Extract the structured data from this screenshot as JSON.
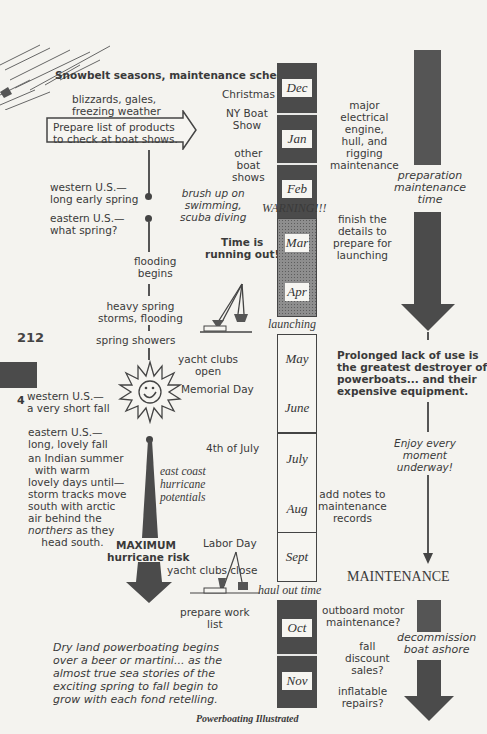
{
  "page": {
    "page_number": "212",
    "chapter_tab": "4",
    "footer": "Powerboating Illustrated"
  },
  "header": {
    "title": "Snowbelt seasons, maintenance schedule."
  },
  "months": [
    {
      "label": "Dec",
      "style": "dark"
    },
    {
      "label": "Jan",
      "style": "dark"
    },
    {
      "label": "Feb",
      "style": "dark"
    },
    {
      "label": "Mar",
      "style": "dotted"
    },
    {
      "label": "Apr",
      "style": "dotted"
    },
    {
      "label": "May",
      "style": "light"
    },
    {
      "label": "June",
      "style": "light"
    },
    {
      "label": "July",
      "style": "light"
    },
    {
      "label": "Aug",
      "style": "light"
    },
    {
      "label": "Sept",
      "style": "light"
    },
    {
      "label": "Oct",
      "style": "dark"
    },
    {
      "label": "Nov",
      "style": "dark"
    }
  ],
  "column_markers": {
    "warning": "WARNING!!!",
    "launching": "launching",
    "haul_out": "haul out time"
  },
  "left_notes": {
    "weather": "blizzards, gales,\nfreezing weather",
    "prepare_list": "Prepare list of products\nto check at boat shows.",
    "western_spring": "western U.S.—\nlong early spring",
    "eastern_spring": "eastern U.S.—\nwhat spring?",
    "flooding": "flooding\nbegins",
    "heavy_spring": "heavy spring\nstorms, flooding",
    "spring_showers": "spring showers",
    "western_fall": "western U.S.—\na very short fall",
    "eastern_fall_1": "eastern U.S.—\nlong, lovely fall",
    "eastern_fall_2": "an Indian summer\n  with warm\nlovely days until—\nstorm tracks move\nsouth with arctic\nair behind the",
    "eastern_fall_northers": "northers",
    "eastern_fall_3": " as they\n    head south.",
    "max_risk_1": "MAXIMUM",
    "max_risk_2": "hurricane risk",
    "dry_land": "Dry land powerboating begins\nover a beer or martini... as the\nalmost true sea stories of the\nexciting spring to fall begin to\ngrow with each fond retelling."
  },
  "mid_notes": {
    "christmas": "Christmas",
    "ny_boat_show": "NY Boat\nShow",
    "other_shows": "other\nboat\nshows",
    "brush_up": "brush up on\nswimming,\nscuba diving",
    "time_running": "Time is\nrunning out!",
    "yacht_open": "yacht clubs\nopen",
    "memorial_day": "Memorial Day",
    "july4": "4th of July",
    "hurricane_potentials": "east coast\nhurricane\npotentials",
    "labor_day": "Labor Day",
    "yacht_close": "yacht clubs close",
    "work_list": "prepare work\nlist"
  },
  "right_notes": {
    "major_maint": "major\nelectrical\nengine,\nhull, and\nrigging\nmaintenance",
    "finish_details": "finish the\ndetails to\nprepare for\nlaunching",
    "add_notes": "add notes to\nmaintenance\nrecords",
    "outboard": "outboard motor\nmaintenance?",
    "fall_sales": "fall\ndiscount\nsales?",
    "inflatable": "inflatable\nrepairs?"
  },
  "far_right": {
    "prep_time": "preparation\nmaintenance\ntime",
    "prolonged": "Prolonged lack of use is\nthe greatest destroyer of\npowerboats... and their\nexpensive equipment.",
    "enjoy": "Enjoy every\nmoment\nunderway!",
    "maintenance": "MAINTENANCE",
    "decommission": "decommission\nboat ashore"
  },
  "icons": {
    "sun": "smiling-sun",
    "crane": "boat-lift-crane",
    "arrows": "down-arrow"
  },
  "colors": {
    "ink": "#3a3a3a",
    "dark_block": "#4b4b4b",
    "paper": "#f4f3ef"
  }
}
